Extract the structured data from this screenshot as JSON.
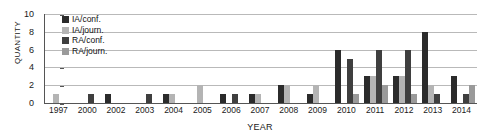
{
  "chart_data": {
    "type": "bar",
    "title": "",
    "xlabel": "YEAR",
    "ylabel": "QUANTITY",
    "ylim": [
      0,
      10
    ],
    "ytick_labels": [
      "0",
      "2",
      "4",
      "6",
      "8",
      "10"
    ],
    "grid": true,
    "legend_position": "top-left-inside",
    "categories": [
      "1997",
      "2000",
      "2002",
      "2003",
      "2004",
      "2005",
      "2006",
      "2007",
      "2008",
      "2009",
      "2010",
      "2011",
      "2012",
      "2013",
      "2014"
    ],
    "series": [
      {
        "name": "IA/conf.",
        "color": "#2b2b2b",
        "values": [
          0,
          0,
          1,
          0,
          1,
          0,
          1,
          1,
          2,
          1,
          6,
          3,
          3,
          8,
          3
        ]
      },
      {
        "name": "IA/journ.",
        "color": "#b4b4b4",
        "values": [
          1,
          0,
          0,
          0,
          1,
          2,
          0,
          1,
          2,
          2,
          0,
          3,
          3,
          2,
          0
        ]
      },
      {
        "name": "RA/conf.",
        "color": "#3f3f3f",
        "values": [
          0,
          1,
          0,
          1,
          0,
          0,
          1,
          0,
          0,
          0,
          5,
          6,
          6,
          1,
          1
        ]
      },
      {
        "name": "RA/journ.",
        "color": "#9a9a9a",
        "values": [
          0,
          0,
          0,
          0,
          0,
          0,
          0,
          0,
          0,
          0,
          1,
          2,
          1,
          0,
          2
        ]
      }
    ]
  },
  "legend": {
    "items": [
      {
        "label": "IA/conf.",
        "color": "#2b2b2b"
      },
      {
        "label": "IA/journ.",
        "color": "#b4b4b4"
      },
      {
        "label": "RA/conf.",
        "color": "#3f3f3f"
      },
      {
        "label": "RA/journ.",
        "color": "#9a9a9a"
      }
    ]
  }
}
